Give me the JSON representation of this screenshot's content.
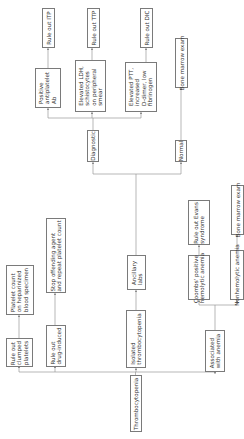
{
  "diagram": {
    "orientation": "rotated-90-ccw",
    "line_color": "#9a9a9a",
    "border_color": "#7a7a7a",
    "nodes": {
      "thrombocytopenia": "Thrombocytopenia",
      "isolated": "Isolated\nthrombocytopenia",
      "associated_anemia": "Associated\nwith anemia",
      "rule_out_clumped": "Rule out\nclumped\nplatelets",
      "rule_out_drug": "Rule out\ndrug-induced",
      "platelet_count_heparin": "Platelet count\non heparinized\nblood specimen",
      "stop_offending": "Stop offending agent\nand repeat platelet count",
      "ancillary_labs": "Ancillary\nlabs",
      "coombs_positive": "Coombs' positive\nhemolytic anemia",
      "nonhemolytic": "Nonhemolytic anemia",
      "rule_out_evans": "Rule out Evans\nsyndrome",
      "bone_marrow_lower": "Bone marrow exam",
      "diagnostic": "Diagnostic",
      "normal": "Normal",
      "positive_antiplatelet": "Positive\nantiplatelet\nAb",
      "elevated_ldh": "Elevated LDH,\nschistocytes\non peripheral\nsmear",
      "elevated_ptt": "Elevated PTT,\nincreased\nD-dimer, low\nfibrinogen",
      "bone_marrow_upper": "Bone marrow exam",
      "rule_out_itp": "Rule out ITP",
      "rule_out_ttp": "Rule out TTP",
      "rule_out_dic": "Rule out DIC"
    }
  }
}
